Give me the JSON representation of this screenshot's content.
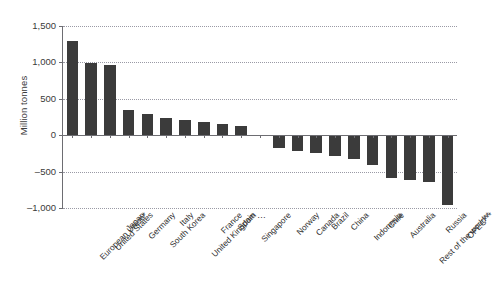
{
  "chart_data": {
    "type": "bar",
    "title": "",
    "xlabel": "",
    "ylabel": "Million tonnes",
    "ylim": [
      -1000,
      1500
    ],
    "yticks": [
      1500,
      1000,
      500,
      0,
      -500,
      -1000
    ],
    "ytick_labels": [
      "1,500",
      "1,000",
      "500",
      "0",
      "–500",
      "–1,000"
    ],
    "grid": true,
    "legend": "none",
    "categories": [
      "European Union*",
      "United States",
      "Japan",
      "Germany",
      "South Korea",
      "Italy",
      "United Kingdom",
      "France",
      "Spain",
      "Singapore",
      "…",
      "Norway",
      "Canada",
      "Brazil",
      "China",
      "Indonesia",
      "Chile",
      "Australia",
      "Rest of the world**",
      "Russia",
      "OPEC***"
    ],
    "values": [
      1300,
      990,
      960,
      345,
      290,
      230,
      205,
      180,
      160,
      130,
      null,
      -170,
      -215,
      -250,
      -290,
      -330,
      -410,
      -590,
      -610,
      -640,
      -960
    ]
  },
  "axis": {
    "y_title": "Million tonnes"
  }
}
